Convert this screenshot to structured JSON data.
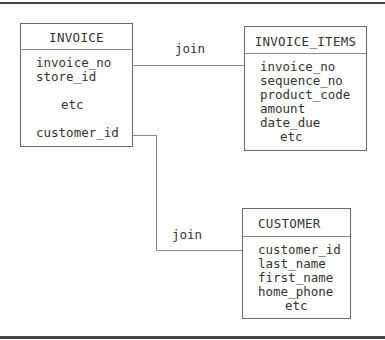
{
  "diagram": {
    "entities": {
      "invoice": {
        "title": "INVOICE",
        "fields": [
          "invoice_no",
          "store_id",
          "etc",
          "customer_id"
        ]
      },
      "invoice_items": {
        "title": "INVOICE_ITEMS",
        "fields": [
          "invoice_no",
          "sequence_no",
          "product_code",
          "amount",
          "date_due",
          "etc"
        ]
      },
      "customer": {
        "title": "CUSTOMER",
        "fields": [
          "customer_id",
          "last_name",
          "first_name",
          "home_phone",
          "etc"
        ]
      }
    },
    "relationships": [
      {
        "label": "join",
        "from": "INVOICE.invoice_no",
        "to": "INVOICE_ITEMS.invoice_no"
      },
      {
        "label": "join",
        "from": "INVOICE.customer_id",
        "to": "CUSTOMER.customer_id"
      }
    ],
    "colors": {
      "border": "#6a6a6a",
      "line": "#8a8a8a",
      "text": "#333333",
      "frame": "#444444"
    }
  }
}
